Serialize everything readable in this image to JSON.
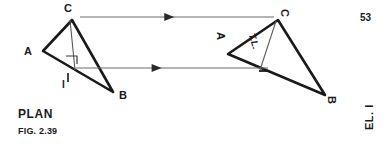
{
  "figure": {
    "number": "FIG. 2.39",
    "page_number": "53",
    "view_left_label": "PLAN",
    "view_right_label": "EL. I",
    "stroke_color": "#1a1a1a",
    "projector_color": "#6b6b6b",
    "background_color": "#ffffff"
  },
  "plan_view": {
    "name": "PLAN",
    "vertices": [
      {
        "label": "A",
        "x": 43,
        "y": 51
      },
      {
        "label": "B",
        "x": 113,
        "y": 92
      },
      {
        "label": "C",
        "x": 72,
        "y": 20
      }
    ],
    "vertex_labels": [
      {
        "label": "A",
        "x": 24,
        "y": 52
      },
      {
        "label": "B",
        "x": 119,
        "y": 95
      },
      {
        "label": "C",
        "x": 65,
        "y": 3
      }
    ],
    "fold_line_label": "I",
    "fold_line_label_pos": {
      "x": 66,
      "y": 72
    },
    "right_angle_marker": true,
    "edge_line": {
      "x1": 70,
      "y1": 20,
      "x2": 75,
      "y2": 70
    }
  },
  "elevation_view": {
    "name": "EL. I",
    "vertices": [
      {
        "label": "A",
        "x": 228,
        "y": 54
      },
      {
        "label": "B",
        "x": 325,
        "y": 95
      },
      {
        "label": "C",
        "x": 278,
        "y": 20
      }
    ],
    "vertex_labels": [
      {
        "label": "A",
        "x": 219,
        "y": 36
      },
      {
        "label": "B",
        "x": 330,
        "y": 98
      },
      {
        "label": "C",
        "x": 285,
        "y": 12
      }
    ],
    "true_length_label": "T.L.",
    "true_length_label_pos": {
      "x": 253,
      "y": 38
    },
    "fold_line_label": "I",
    "fold_line_label_pos": {
      "x": 264,
      "y": 68
    },
    "edge_line": {
      "x1": 276,
      "y1": 21,
      "x2": 260,
      "y2": 70
    }
  },
  "projectors": [
    {
      "name": "projector-c",
      "x1": 80,
      "y1": 17,
      "x2": 274,
      "y2": 17,
      "arrow_at": 0.46,
      "direction": "right"
    },
    {
      "name": "projector-ab",
      "x1": 76,
      "y1": 68,
      "x2": 268,
      "y2": 68,
      "arrow_at": 0.42,
      "direction": "right"
    }
  ]
}
